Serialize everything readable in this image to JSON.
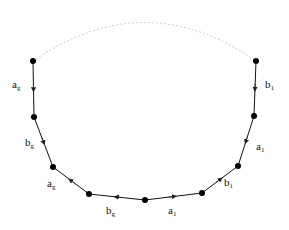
{
  "figure": {
    "background_color": "#ffffff",
    "stroke_color": "#111111",
    "vertex_color": "#000000",
    "dotted_arc_color": "#cfcfcf",
    "vertex_radius": 3,
    "width": 289,
    "height": 230,
    "vertices": [
      {
        "id": "v0",
        "x": 33,
        "y": 61
      },
      {
        "id": "v1",
        "x": 34,
        "y": 117
      },
      {
        "id": "v2",
        "x": 53,
        "y": 167
      },
      {
        "id": "v3",
        "x": 89,
        "y": 194
      },
      {
        "id": "v4",
        "x": 145,
        "y": 200
      },
      {
        "id": "v5",
        "x": 202,
        "y": 193
      },
      {
        "id": "v6",
        "x": 238,
        "y": 166
      },
      {
        "id": "v7",
        "x": 254,
        "y": 116
      },
      {
        "id": "v8",
        "x": 256,
        "y": 61
      }
    ],
    "dotted_arc": {
      "from": "v0",
      "to": "v8",
      "control_x": 145,
      "control_y": -16,
      "dash": "1 3"
    },
    "edges": [
      {
        "id": "e0",
        "from": "v0",
        "to": "v1",
        "label": "a",
        "subscript": "g",
        "arrow_direction": "down",
        "label_x": 12,
        "label_y": 79
      },
      {
        "id": "e1",
        "from": "v1",
        "to": "v2",
        "label": "b",
        "subscript": "g",
        "arrow_direction": "down-right",
        "label_x": 25,
        "label_y": 137
      },
      {
        "id": "e2",
        "from": "v3",
        "to": "v2",
        "label": "a",
        "subscript": "g",
        "arrow_direction": "up-left",
        "label_x": 47,
        "label_y": 178
      },
      {
        "id": "e3",
        "from": "v4",
        "to": "v3",
        "label": "b",
        "subscript": "g",
        "arrow_direction": "left",
        "label_x": 106,
        "label_y": 205
      },
      {
        "id": "e4",
        "from": "v4",
        "to": "v5",
        "label": "a",
        "subscript": "1",
        "arrow_direction": "right",
        "label_x": 168,
        "label_y": 205
      },
      {
        "id": "e5",
        "from": "v5",
        "to": "v6",
        "label": "b",
        "subscript": "1",
        "arrow_direction": "up-right",
        "label_x": 224,
        "label_y": 177
      },
      {
        "id": "e6",
        "from": "v7",
        "to": "v6",
        "label": "a",
        "subscript": "1",
        "arrow_direction": "down-left",
        "label_x": 256,
        "label_y": 141
      },
      {
        "id": "e7",
        "from": "v8",
        "to": "v7",
        "label": "b",
        "subscript": "1",
        "arrow_direction": "down",
        "label_x": 265,
        "label_y": 79
      }
    ]
  }
}
